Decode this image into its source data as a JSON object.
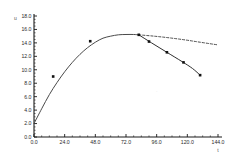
{
  "chart_data": {
    "type": "line",
    "title": "",
    "xlabel": "t",
    "ylabel": "u",
    "xlim": [
      0,
      144
    ],
    "ylim": [
      0,
      18
    ],
    "grid": false,
    "legend": "none",
    "xticks": [
      "0.0",
      "24.0",
      "48.0",
      "72.0",
      "96.0",
      "120.0",
      "144.0"
    ],
    "xtick_values": [
      0,
      24,
      48,
      72,
      96,
      120,
      144
    ],
    "yticks": [
      "0.0",
      "2.0",
      "4.0",
      "6.0",
      "8.0",
      "10.0",
      "12.0",
      "14.0",
      "16.0",
      "18.0"
    ],
    "ytick_values": [
      0,
      2,
      4,
      6,
      8,
      10,
      12,
      14,
      16,
      18
    ],
    "series": [
      {
        "name": "main-curve",
        "style": "solid",
        "color": "#4a4a4a",
        "x": [
          0,
          6,
          12,
          18,
          24,
          30,
          36,
          42,
          48,
          54,
          60,
          66,
          72,
          78,
          82
        ],
        "values": [
          2.0,
          4.2,
          6.3,
          8.1,
          9.7,
          11.1,
          12.3,
          13.3,
          14.1,
          14.7,
          15.0,
          15.2,
          15.25,
          15.25,
          15.2
        ]
      },
      {
        "name": "dashed-branch",
        "style": "dashed",
        "color": "#3a3a3a",
        "x": [
          82,
          94,
          106,
          118,
          130,
          144
        ],
        "values": [
          15.2,
          15.0,
          14.75,
          14.45,
          14.1,
          13.7
        ]
      },
      {
        "name": "declining-branch",
        "style": "solid-marked",
        "color": "#2e2e2e",
        "x": [
          82,
          92,
          104,
          116,
          124,
          130
        ],
        "values": [
          15.2,
          14.0,
          12.6,
          11.2,
          10.2,
          9.2
        ]
      }
    ],
    "markers": [
      {
        "x": 15,
        "y": 9.0
      },
      {
        "x": 44,
        "y": 14.25
      },
      {
        "x": 82,
        "y": 15.2
      },
      {
        "x": 90,
        "y": 14.2
      },
      {
        "x": 104,
        "y": 12.6
      },
      {
        "x": 117,
        "y": 11.1
      },
      {
        "x": 130,
        "y": 9.2
      }
    ],
    "annotations": [
      {
        "name": "faint-mark",
        "x": 96,
        "y": 6.6,
        "text": "·"
      }
    ]
  },
  "axis_geometry": {
    "plot_left": 34,
    "plot_right": 218,
    "plot_top": 16,
    "plot_bottom": 137
  },
  "colors": {
    "axis": "#1a1a1a",
    "curve": "#4a4a4a",
    "dashed": "#333333",
    "marker": "#111111",
    "tick_text": "#2b2b2b"
  }
}
